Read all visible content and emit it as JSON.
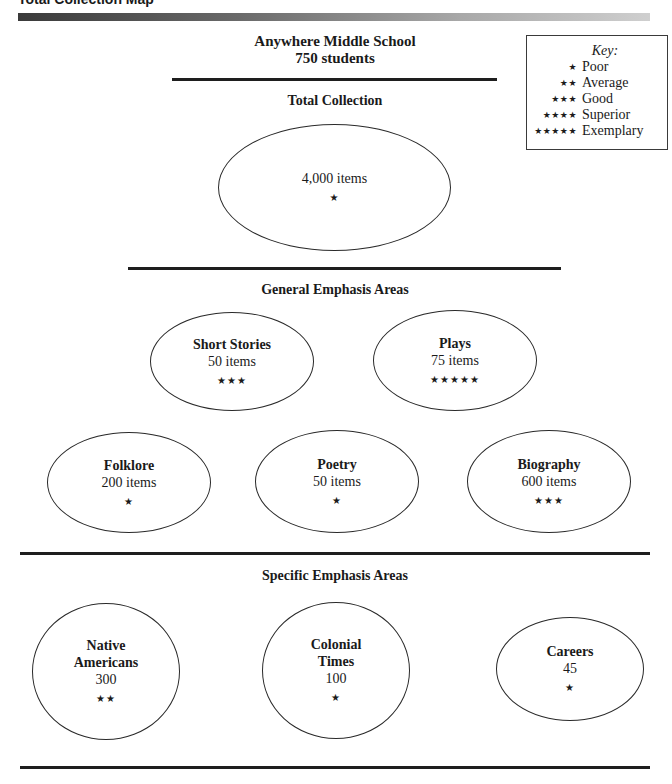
{
  "page": {
    "title": "Total Collection Map"
  },
  "header": {
    "school_name": "Anywhere Middle School",
    "enrollment": "750 students"
  },
  "key": {
    "title": "Key:",
    "entries": [
      {
        "stars": "★",
        "label": "Poor"
      },
      {
        "stars": "★★",
        "label": "Average"
      },
      {
        "stars": "★★★",
        "label": "Good"
      },
      {
        "stars": "★★★★",
        "label": "Superior"
      },
      {
        "stars": "★★★★★",
        "label": "Exemplary"
      }
    ]
  },
  "total_collection": {
    "heading": "Total Collection",
    "count": "4,000 items",
    "stars": "★"
  },
  "general_emphasis": {
    "heading": "General Emphasis Areas",
    "areas": [
      {
        "name": "Short Stories",
        "count": "50 items",
        "stars": "★★★"
      },
      {
        "name": "Plays",
        "count": "75 items",
        "stars": "★★★★★"
      },
      {
        "name": "Folklore",
        "count": "200 items",
        "stars": "★"
      },
      {
        "name": "Poetry",
        "count": "50 items",
        "stars": "★"
      },
      {
        "name": "Biography",
        "count": "600 items",
        "stars": "★★★"
      }
    ]
  },
  "specific_emphasis": {
    "heading": "Specific Emphasis Areas",
    "areas": [
      {
        "name_line1": "Native",
        "name_line2": "Americans",
        "count": "300",
        "stars": "★★"
      },
      {
        "name_line1": "Colonial",
        "name_line2": "Times",
        "count": "100",
        "stars": "★"
      },
      {
        "name_line1": "Careers",
        "name_line2": "",
        "count": "45",
        "stars": "★"
      }
    ]
  }
}
